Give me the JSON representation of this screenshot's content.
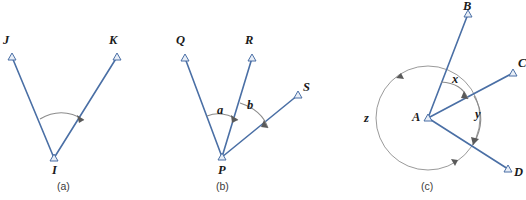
{
  "figure": {
    "background_color": "#ffffff",
    "line_color": "#4a6fa5",
    "arc_color": "#8c8c8c",
    "circle_color": "#9a9a9a",
    "label_color": "#1a1a1a",
    "width": 526,
    "height": 200
  },
  "panels": [
    {
      "id": "a",
      "caption": "(a)",
      "vertex_label": "I",
      "point_labels": [
        "J",
        "K"
      ],
      "angle_labels": [],
      "description": "Angle JIK with one arc from ray IJ to ray IK"
    },
    {
      "id": "b",
      "caption": "(b)",
      "vertex_label": "P",
      "point_labels": [
        "Q",
        "R",
        "S"
      ],
      "angle_labels": [
        "a",
        "b"
      ],
      "description": "Rays PQ, PR, PS from vertex P; angle a = QPR, angle b = RPS"
    },
    {
      "id": "c",
      "caption": "(c)",
      "vertex_label": "A",
      "point_labels": [
        "B",
        "C",
        "D"
      ],
      "angle_labels": [
        "x",
        "y",
        "z"
      ],
      "description": "Rays AB, AC, AD from vertex A; angle x = BAC, angle y = CAD, reflex angle z = BAD"
    }
  ],
  "labels": {
    "a_J": "J",
    "a_K": "K",
    "a_I": "I",
    "a_caption": "(a)",
    "b_Q": "Q",
    "b_R": "R",
    "b_S": "S",
    "b_P": "P",
    "b_angle_a": "a",
    "b_angle_b": "b",
    "b_caption": "(b)",
    "c_B": "B",
    "c_C": "C",
    "c_D": "D",
    "c_A": "A",
    "c_angle_x": "x",
    "c_angle_y": "y",
    "c_angle_z": "z",
    "c_caption": "(c)"
  }
}
